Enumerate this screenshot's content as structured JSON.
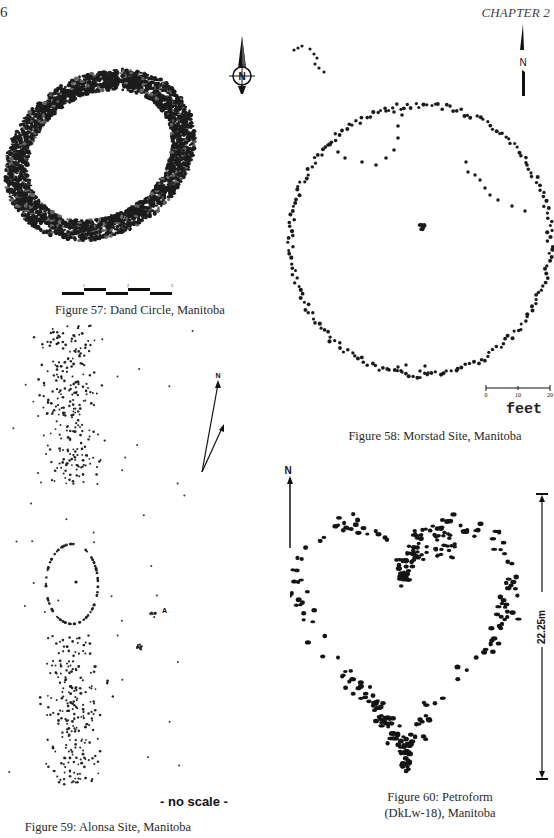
{
  "page": {
    "page_number": "6",
    "running_head": "CHAPTER 2"
  },
  "figures": [
    {
      "id": "fig57",
      "caption": "Figure 57: Dand Circle, Manitoba",
      "north_label": "N",
      "scale_ticks": [
        "1",
        "2",
        "3"
      ],
      "shape": "dense oval ring of stones"
    },
    {
      "id": "fig58",
      "caption": "Figure 58: Morstad Site, Manitoba",
      "north_label": "N",
      "scale_ticks": [
        "0",
        "10",
        "20"
      ],
      "scale_unit": "feet",
      "shape": "large circle of stones with interior lines and central cairn"
    },
    {
      "id": "fig59",
      "caption": "Figure 59: Alonsa Site, Manitoba",
      "north_label": "N",
      "scale_note": "- no scale -",
      "point_label": "A",
      "shape": "two dispersed stone scatters with small ring between"
    },
    {
      "id": "fig60",
      "caption_line1": "Figure 60: Petroform",
      "caption_line2": "(DkLw-18), Manitoba",
      "north_label": "N",
      "dimension_label": "22.25m",
      "shape": "heart-shaped boulder outline"
    }
  ],
  "colors": {
    "ink": "#1a1a1a",
    "paper": "#ffffff",
    "caption": "#2a2a2a"
  }
}
